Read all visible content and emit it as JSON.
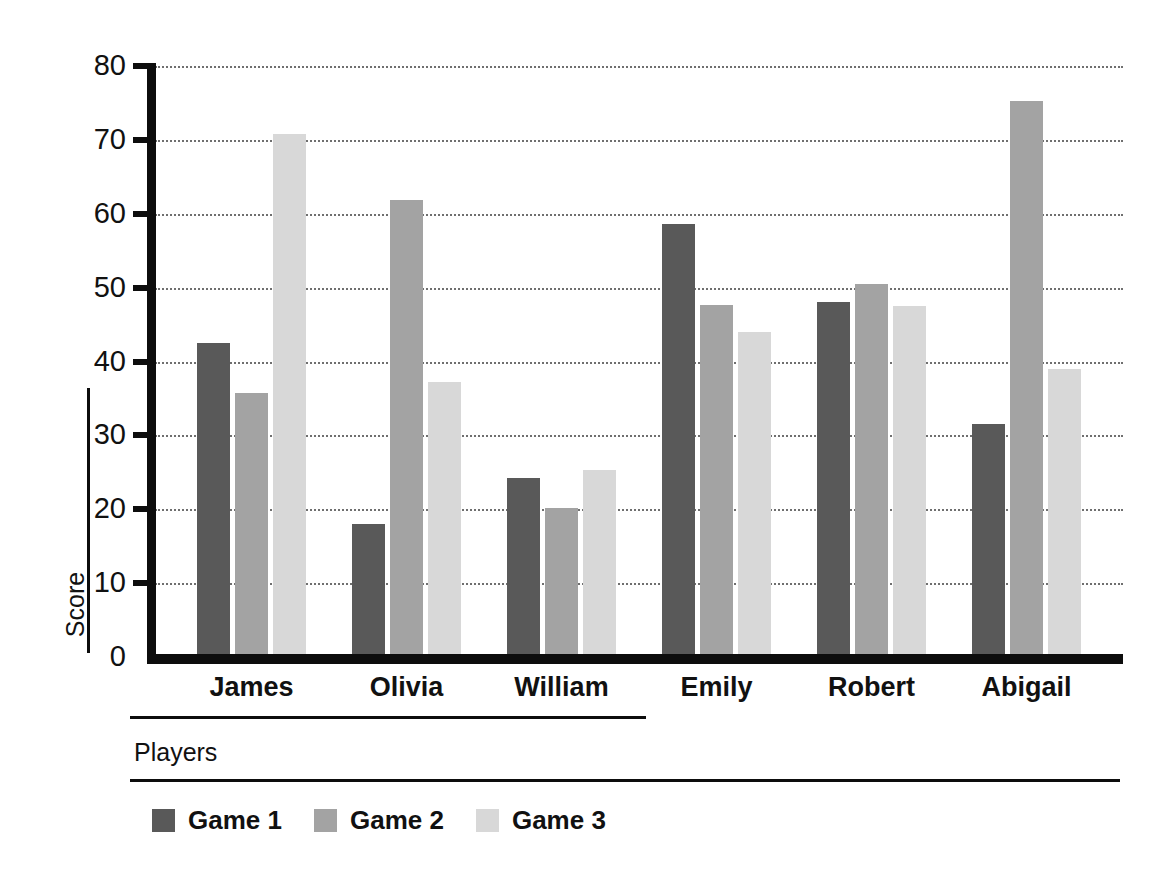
{
  "chart_data": {
    "type": "bar",
    "title": "",
    "xlabel": "Players",
    "ylabel": "Score",
    "categories": [
      "James",
      "Olivia",
      "William",
      "Emily",
      "Robert",
      "Abigail"
    ],
    "series": [
      {
        "name": "Game 1",
        "color": "#595959",
        "values": [
          42.5,
          18.0,
          24.2,
          58.6,
          48.0,
          31.5
        ]
      },
      {
        "name": "Game 2",
        "color": "#a3a3a3",
        "values": [
          35.7,
          61.8,
          20.2,
          47.7,
          50.5,
          75.3
        ]
      },
      {
        "name": "Game 3",
        "color": "#d8d8d8",
        "values": [
          70.8,
          37.2,
          25.3,
          44.0,
          47.5,
          39.0
        ]
      }
    ],
    "ylim": [
      0,
      80
    ],
    "yticks": [
      0,
      10,
      20,
      30,
      40,
      50,
      60,
      70,
      80
    ],
    "ytick_labels": [
      "0",
      "10",
      "20",
      "30",
      "40",
      "50",
      "60",
      "70",
      "80"
    ],
    "grid": true,
    "grid_axis": "y",
    "grid_style": "dotted",
    "legend_position": "bottom-left",
    "axis_color": "#0d0d0d",
    "background": "#ffffff"
  }
}
